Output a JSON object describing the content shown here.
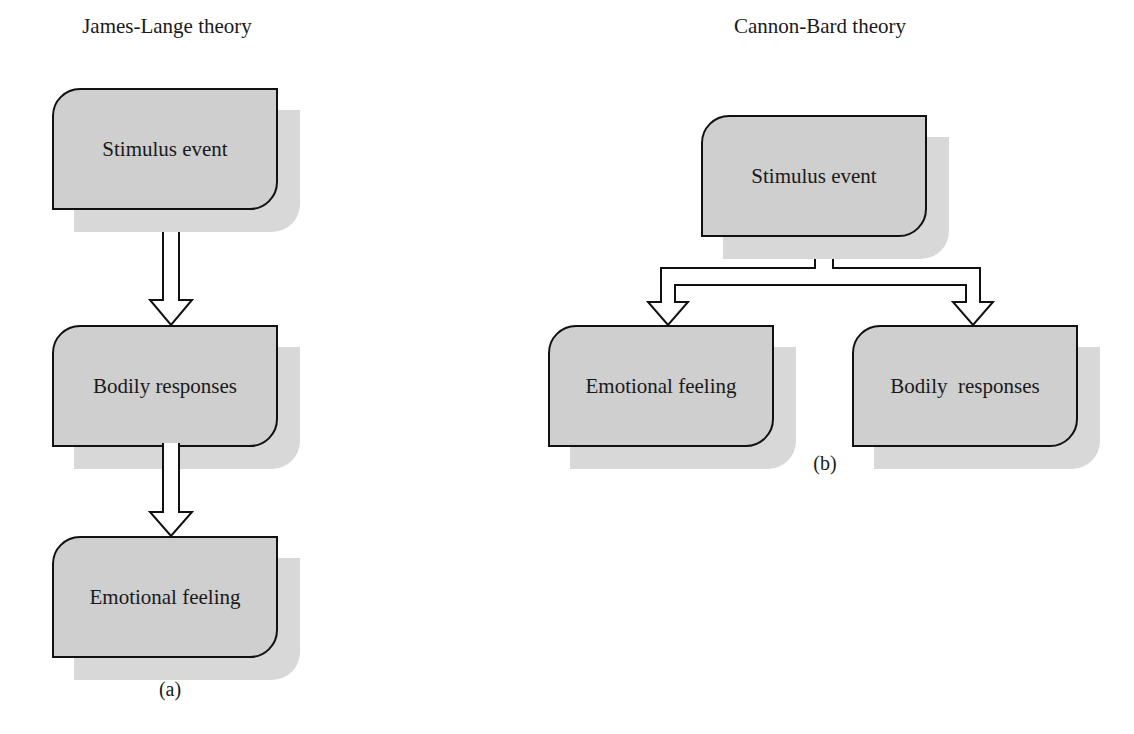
{
  "panel_a": {
    "title": "James-Lange theory",
    "caption": "(a)",
    "nodes": [
      "Stimulus event",
      "Bodily responses",
      "Emotional feeling"
    ]
  },
  "panel_b": {
    "title": "Cannon-Bard theory",
    "caption": "(b)",
    "nodes": {
      "source": "Stimulus event",
      "left": "Emotional feeling",
      "right": "Bodily  responses"
    }
  },
  "colors": {
    "box_fill": "#cfcfcf",
    "shadow": "#d8d8d8",
    "stroke": "#111111"
  }
}
